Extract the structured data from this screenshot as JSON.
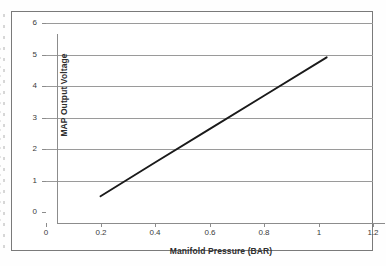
{
  "chart_data": {
    "type": "line",
    "title": "",
    "xlabel": "Manifold Pressure (BAR)",
    "ylabel": "MAP Output Voltage",
    "xlim": [
      0,
      1.2
    ],
    "ylim": [
      0,
      6
    ],
    "xticks": [
      "0",
      "0.2",
      "0.4",
      "0.6",
      "0.8",
      "1",
      "1.2"
    ],
    "xtick_values": [
      0,
      0.2,
      0.4,
      0.6,
      0.8,
      1,
      1.2
    ],
    "yticks": [
      "0",
      "1",
      "2",
      "3",
      "4",
      "5",
      "6"
    ],
    "ytick_values": [
      0,
      1,
      2,
      3,
      4,
      5,
      6
    ],
    "grid": "horizontal",
    "legend": "none",
    "series": [
      {
        "name": "MAP sensor transfer function",
        "x": [
          0.2,
          0.4,
          0.6,
          0.8,
          1.03
        ],
        "values": [
          0.5,
          1.57,
          2.63,
          3.69,
          4.91
        ]
      }
    ]
  }
}
